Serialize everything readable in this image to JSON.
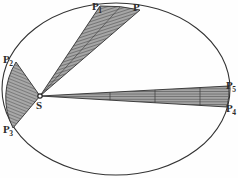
{
  "figure": {
    "background_color": "#fefefe",
    "ink_color": "#2b2b2b",
    "hatch_color": "#555555",
    "sector_fill": "#9a9a9a"
  },
  "orbit": {
    "name": "elliptical-orbit",
    "center_x": 116,
    "center_y": 89,
    "radius_x": 114,
    "radius_y": 86,
    "stroke_color": "#333333",
    "stroke_width": 1.1
  },
  "focus": {
    "name": "sun-focus",
    "label": "S",
    "x": 40,
    "y": 96,
    "label_x": 36,
    "label_y": 100,
    "marker_radius": 2.2
  },
  "points": [
    {
      "id": "P",
      "base": "P",
      "sub": "",
      "x": 140,
      "y": 10,
      "label_x": 133,
      "label_y": 2
    },
    {
      "id": "P1",
      "base": "P",
      "sub": "1",
      "x": 100,
      "y": 6,
      "label_x": 92,
      "label_y": 1
    },
    {
      "id": "P2",
      "base": "P",
      "sub": "2",
      "x": 16,
      "y": 62,
      "label_x": 3,
      "label_y": 54
    },
    {
      "id": "P3",
      "base": "P",
      "sub": "3",
      "x": 13,
      "y": 128,
      "label_x": 3,
      "label_y": 124
    },
    {
      "id": "P4",
      "base": "P",
      "sub": "4",
      "x": 227,
      "y": 107,
      "label_x": 226,
      "label_y": 103
    },
    {
      "id": "P5",
      "base": "P",
      "sub": "5",
      "x": 229,
      "y": 86,
      "label_x": 226,
      "label_y": 80
    }
  ],
  "sectors": [
    {
      "id": "sector-top",
      "name": "swept-area-P1-P",
      "from_point": "P1",
      "to_point": "P",
      "hatch_angle": 72,
      "divider_count": 1
    },
    {
      "id": "sector-left",
      "name": "swept-area-P2-P3",
      "from_point": "P2",
      "to_point": "P3",
      "hatch_angle": 110,
      "divider_count": 0
    },
    {
      "id": "sector-right",
      "name": "swept-area-P5-P4",
      "from_point": "P5",
      "to_point": "P4",
      "hatch_angle": 90,
      "divider_count": 3
    }
  ]
}
